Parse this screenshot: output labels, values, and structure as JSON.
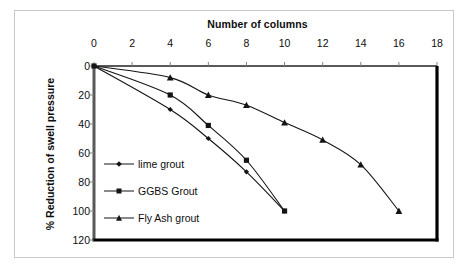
{
  "chart_data": {
    "type": "line",
    "title": "Number of columns",
    "xlabel": "Number of columns",
    "ylabel": "% Reduction of swell pressure",
    "xlim": [
      0,
      18
    ],
    "ylim": [
      0,
      120
    ],
    "y_inverted": true,
    "x_axis_position": "top",
    "grid": false,
    "legend_position": "inside-left-center",
    "xticks": [
      0,
      2,
      4,
      6,
      8,
      10,
      12,
      14,
      16,
      18
    ],
    "yticks": [
      0,
      20,
      40,
      60,
      80,
      100,
      120
    ],
    "series": [
      {
        "name": "lime grout",
        "marker": "diamond",
        "x": [
          0,
          4,
          6,
          8,
          10
        ],
        "values": [
          0,
          30,
          50,
          73,
          100
        ]
      },
      {
        "name": "GGBS Grout",
        "marker": "square",
        "x": [
          0,
          4,
          6,
          8,
          10
        ],
        "values": [
          0,
          20,
          41,
          65,
          100
        ]
      },
      {
        "name": "Fly Ash grout",
        "marker": "triangle",
        "x": [
          0,
          4,
          6,
          8,
          10,
          12,
          14,
          16
        ],
        "values": [
          0,
          8,
          20,
          27,
          39,
          51,
          68,
          100
        ]
      }
    ],
    "colors": {
      "line": "#141414",
      "marker": "#141414",
      "plot_border": "#000000",
      "outer_border": "#c8c8c8",
      "text": "#0d0d0d",
      "background": "#ffffff"
    }
  },
  "legend": {
    "items": [
      {
        "label": "lime grout"
      },
      {
        "label": "GGBS Grout"
      },
      {
        "label": "Fly Ash grout"
      }
    ]
  }
}
